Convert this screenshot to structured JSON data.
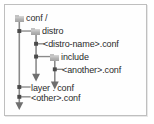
{
  "diagram": {
    "type": "directory-tree",
    "colors": {
      "border": "#bfbfbf",
      "background": "#fefefe",
      "line": "#8a8a8a",
      "text": "#2b2b2b",
      "folder_icon": "#b4b4b4"
    },
    "nodes": [
      {
        "id": "root",
        "label": "conf /",
        "icon": "folder-icon",
        "depth": 0,
        "has_folder_icon": true
      },
      {
        "id": "distro",
        "label": "distro",
        "icon": "folder-icon",
        "depth": 1,
        "has_folder_icon": true
      },
      {
        "id": "distro-name",
        "label": "<distro-name>.conf",
        "depth": 2,
        "has_folder_icon": false
      },
      {
        "id": "include",
        "label": "include",
        "icon": "folder-icon",
        "depth": 2,
        "has_folder_icon": true
      },
      {
        "id": "another",
        "label": "<another>.conf",
        "depth": 3,
        "has_folder_icon": false
      },
      {
        "id": "layer",
        "label": "layer . conf",
        "depth": 1,
        "has_folder_icon": false
      },
      {
        "id": "other",
        "label": "<other>.conf",
        "depth": 1,
        "has_folder_icon": false
      }
    ],
    "continuation_arrows": [
      {
        "id": "arrow-root-trunk",
        "direction": "down"
      },
      {
        "id": "arrow-distro-trunk",
        "direction": "down"
      },
      {
        "id": "arrow-include-trunk",
        "direction": "down"
      }
    ]
  }
}
